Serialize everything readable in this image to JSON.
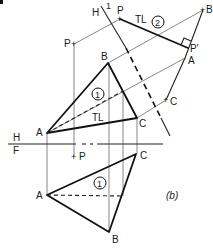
{
  "figure": {
    "caption": "(b)",
    "corner_fragment": ""
  },
  "fold_lines": {
    "hf": {
      "top_label": "H",
      "bottom_label": "F"
    },
    "h1": {
      "left_label": "H",
      "right_label": "1"
    }
  },
  "top_view": {
    "points": {
      "A": "A",
      "B": "B",
      "C": "C",
      "P": "P"
    },
    "true_length_label": "TL",
    "plane_number": "1"
  },
  "front_view": {
    "points": {
      "A": "A",
      "B": "B",
      "C": "C",
      "P": "P"
    },
    "plane_number": "1"
  },
  "auxiliary_view_1": {
    "points": {
      "A": "A",
      "B": "B",
      "C": "C",
      "P": "P",
      "P_prime": "P'"
    },
    "true_length_label": "TL",
    "line_number": "2"
  },
  "colors": {
    "line": "#111111",
    "projection": "#555555",
    "background": "#ffffff"
  }
}
